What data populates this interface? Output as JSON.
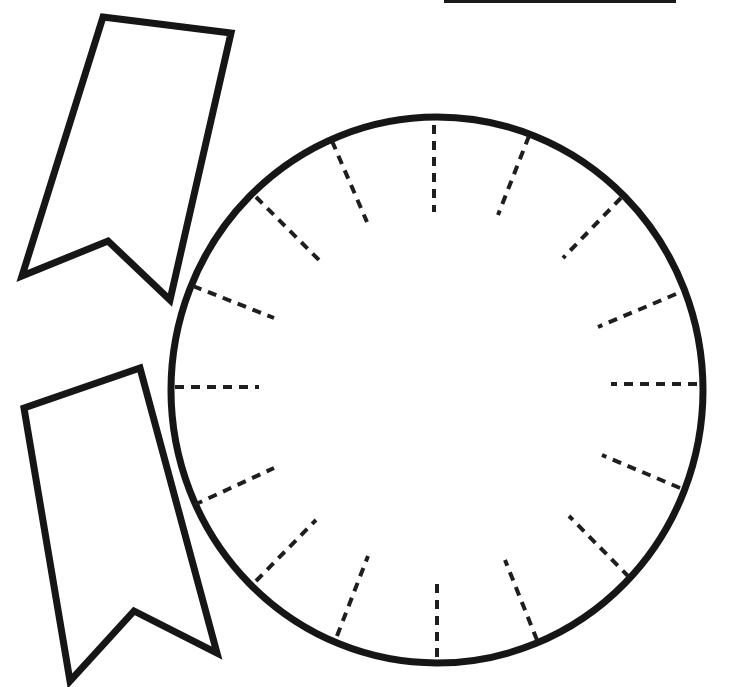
{
  "colors": {
    "stroke": "#161616",
    "background": "#ffffff"
  },
  "top_line": {
    "x1": 444,
    "y1": 1,
    "x2": 676,
    "y2": 1
  },
  "ribbons": [
    {
      "name": "upper-ribbon",
      "points": [
        [
          103,
          17
        ],
        [
          231,
          33
        ],
        [
          170,
          300
        ],
        [
          108,
          241
        ],
        [
          22,
          276
        ]
      ]
    },
    {
      "name": "lower-ribbon",
      "points": [
        [
          24,
          408
        ],
        [
          140,
          368
        ],
        [
          217,
          653
        ],
        [
          134,
          611
        ],
        [
          70,
          681
        ]
      ]
    }
  ],
  "dial": {
    "cx": 437,
    "cy": 390,
    "rx": 266,
    "ry": 273,
    "tick_count": 16,
    "ticks": [
      [
        434,
        125,
        434,
        212
      ],
      [
        529,
        136,
        498,
        215
      ],
      [
        621,
        198,
        563,
        258
      ],
      [
        676,
        294,
        598,
        327
      ],
      [
        697,
        384,
        611,
        384
      ],
      [
        680,
        488,
        602,
        455
      ],
      [
        629,
        577,
        569,
        516
      ],
      [
        537,
        640,
        505,
        560
      ],
      [
        437,
        657,
        437,
        578
      ],
      [
        337,
        636,
        368,
        556
      ],
      [
        256,
        581,
        316,
        520
      ],
      [
        194,
        505,
        274,
        468
      ],
      [
        175,
        387,
        259,
        387
      ],
      [
        193,
        286,
        274,
        318
      ],
      [
        256,
        197,
        319,
        260
      ],
      [
        332,
        141,
        367,
        222
      ]
    ]
  }
}
